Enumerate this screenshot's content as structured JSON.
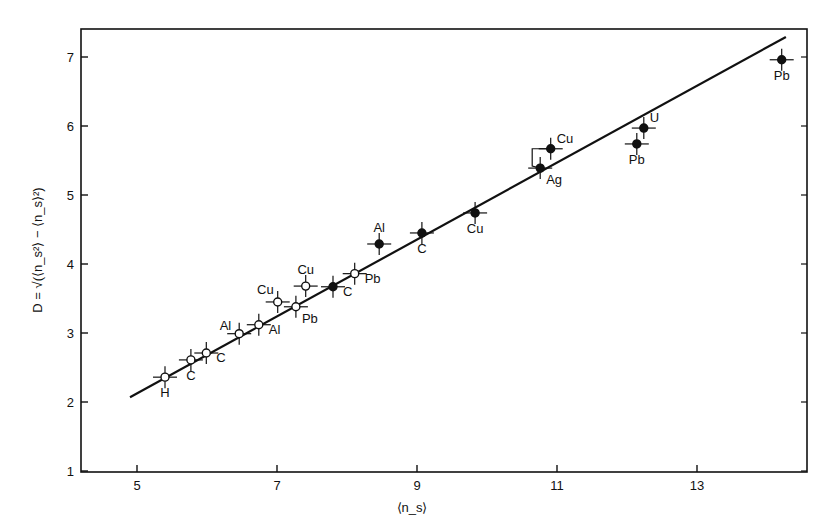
{
  "chart_data": {
    "type": "scatter",
    "title": "",
    "xlabel": "⟨n_s⟩",
    "ylabel": "D = √(⟨n_s²⟩ − ⟨n_s⟩²)",
    "xlim": [
      4.2,
      14.5
    ],
    "ylim": [
      1,
      7.6
    ],
    "xticks": [
      5,
      7,
      9,
      11,
      13
    ],
    "yticks": [
      1,
      2,
      3,
      4,
      5,
      6,
      7
    ],
    "grid": false,
    "legend": null,
    "series": [
      {
        "name": "open circles",
        "marker": "open-circle",
        "points": [
          {
            "label": "H",
            "x": 5.4,
            "y": 2.36,
            "label_pos": "below"
          },
          {
            "label": "C",
            "x": 5.77,
            "y": 2.61,
            "label_pos": "below"
          },
          {
            "label": "C",
            "x": 5.99,
            "y": 2.71,
            "label_pos": "right"
          },
          {
            "label": "Al",
            "x": 6.46,
            "y": 2.99,
            "label_pos": "left"
          },
          {
            "label": "Al",
            "x": 6.74,
            "y": 3.12,
            "label_pos": "right"
          },
          {
            "label": "Cu",
            "x": 7.01,
            "y": 3.45,
            "label_pos": "upper-left"
          },
          {
            "label": "Pb",
            "x": 7.27,
            "y": 3.38,
            "label_pos": "lower-right"
          },
          {
            "label": "Cu",
            "x": 7.41,
            "y": 3.68,
            "label_pos": "above"
          },
          {
            "label": "Pb",
            "x": 8.11,
            "y": 3.86,
            "label_pos": "right"
          }
        ]
      },
      {
        "name": "filled circles",
        "marker": "filled-circle",
        "points": [
          {
            "label": "C",
            "x": 7.8,
            "y": 3.67,
            "label_pos": "right"
          },
          {
            "label": "Al",
            "x": 8.46,
            "y": 4.29,
            "label_pos": "above"
          },
          {
            "label": "C",
            "x": 9.07,
            "y": 4.45,
            "label_pos": "below"
          },
          {
            "label": "Cu",
            "x": 9.83,
            "y": 4.74,
            "label_pos": "below"
          },
          {
            "label": "Ag",
            "x": 10.76,
            "y": 5.39,
            "label_pos": "lower-right"
          },
          {
            "label": "Cu",
            "x": 10.91,
            "y": 5.67,
            "label_pos": "upper-right"
          },
          {
            "label": "Pb",
            "x": 12.14,
            "y": 5.74,
            "label_pos": "below"
          },
          {
            "label": "U",
            "x": 12.24,
            "y": 5.97,
            "label_pos": "upper-right"
          },
          {
            "label": "Pb",
            "x": 14.21,
            "y": 6.96,
            "label_pos": "below"
          }
        ]
      }
    ],
    "fit_line": {
      "x": [
        4.9,
        14.27
      ],
      "y": [
        2.07,
        7.29
      ]
    },
    "annotations": [
      "bracket connecting Ag and Cu points near ⟨n_s⟩ ≈ 10.8"
    ]
  }
}
